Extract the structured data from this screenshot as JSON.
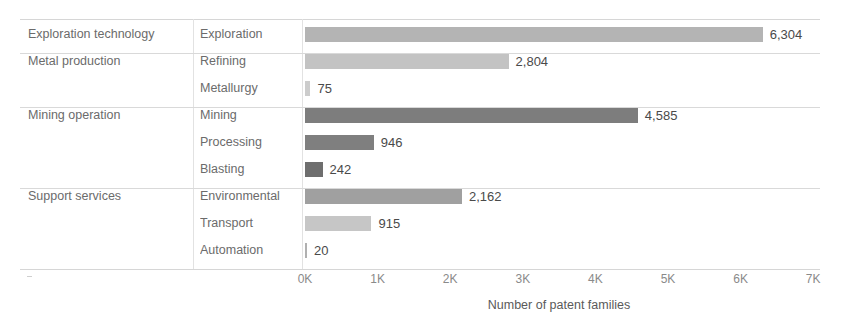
{
  "chart_data": {
    "type": "bar",
    "orientation": "horizontal",
    "title": "",
    "xlabel": "Number of patent families",
    "ylabel": "",
    "xlim": [
      0,
      7000
    ],
    "grid": false,
    "legend": "none",
    "columns": [
      "Technology group",
      "Technology subfield",
      "Number of patent families"
    ],
    "tick_labels": [
      "0K",
      "1K",
      "2K",
      "3K",
      "4K",
      "5K",
      "6K",
      "7K"
    ],
    "tick_values": [
      0,
      1000,
      2000,
      3000,
      4000,
      5000,
      6000,
      7000
    ],
    "groups": [
      {
        "group": "Exploration technology",
        "rows": [
          {
            "category": "Exploration",
            "value": 6304,
            "label": "6,304",
            "color": "#b4b4b4"
          }
        ]
      },
      {
        "group": "Metal production",
        "rows": [
          {
            "category": "Refining",
            "value": 2804,
            "label": "2,804",
            "color": "#c3c3c3"
          },
          {
            "category": "Metallurgy",
            "value": 75,
            "label": "75",
            "color": "#cccccc"
          }
        ]
      },
      {
        "group": "Mining operation",
        "rows": [
          {
            "category": "Mining",
            "value": 4585,
            "label": "4,585",
            "color": "#7d7d7d"
          },
          {
            "category": "Processing",
            "value": 946,
            "label": "946",
            "color": "#7f7f7f"
          },
          {
            "category": "Blasting",
            "value": 242,
            "label": "242",
            "color": "#6e6e6e"
          }
        ]
      },
      {
        "group": "Support services",
        "rows": [
          {
            "category": "Environmental",
            "value": 2162,
            "label": "2,162",
            "color": "#a0a0a0"
          },
          {
            "category": "Transport",
            "value": 915,
            "label": "915",
            "color": "#c6c6c6"
          },
          {
            "category": "Automation",
            "value": 20,
            "label": "20",
            "color": "#b0b0b0"
          }
        ]
      }
    ]
  }
}
